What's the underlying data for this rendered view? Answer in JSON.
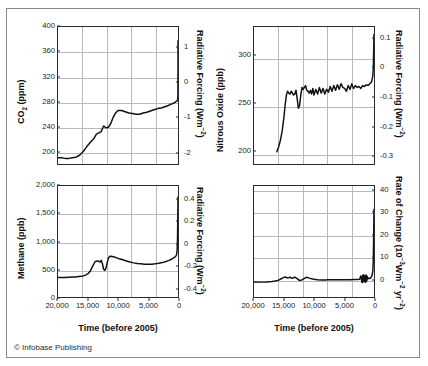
{
  "figure": {
    "credit": "© Infobase Publishing",
    "background_color": "#ffffff",
    "line_color": "#111111",
    "grid_color": "#b9b9b9",
    "axis_color": "#2b2b2b"
  },
  "chart_data": [
    {
      "id": "co2",
      "type": "line",
      "title": "",
      "panel_position": "top-left",
      "xlabel": "",
      "ylabel": "CO2 (ppm)",
      "ylabel_parts": {
        "main": "CO",
        "sub": "2",
        "tail": " (ppm)"
      },
      "y2label": "Radiative Forcing (Wm-2)",
      "y2label_parts": {
        "main": "Radiative Forcing (Wm",
        "sup": "-2",
        "tail": ")"
      },
      "xlim": [
        20000,
        0
      ],
      "ylim": [
        180,
        400
      ],
      "y2lim": [
        -2.35,
        1.6
      ],
      "xticks": [
        20000,
        15000,
        10000,
        5000,
        0
      ],
      "xticklabels": [
        "20,000",
        "15,000",
        "10,000",
        "5,000",
        "0"
      ],
      "yticks": [
        200,
        240,
        280,
        320,
        360,
        400
      ],
      "yticklabels": [
        "200",
        "240",
        "280",
        "320",
        "360",
        "400"
      ],
      "y2ticks": [
        -2,
        -1,
        0,
        1
      ],
      "y2ticklabels": [
        "-2",
        "-1",
        "0",
        "1"
      ],
      "grid": true,
      "x": [
        20000,
        19400,
        18800,
        18200,
        17600,
        17000,
        16400,
        15800,
        15200,
        14600,
        14000,
        13600,
        13200,
        12800,
        12400,
        12000,
        11600,
        11200,
        10800,
        10400,
        10000,
        9400,
        8800,
        8200,
        7600,
        7000,
        6400,
        5800,
        5200,
        4600,
        4000,
        3400,
        2800,
        2200,
        1600,
        1200,
        900,
        700,
        500,
        350,
        250,
        180,
        140,
        110,
        80,
        55,
        40,
        25,
        15,
        8,
        3,
        0
      ],
      "y": [
        190,
        190,
        189,
        189,
        190,
        191,
        194,
        200,
        208,
        215,
        221,
        228,
        230,
        232,
        241,
        238,
        239,
        245,
        255,
        262,
        266,
        266,
        264,
        262,
        261,
        260,
        260,
        262,
        263,
        265,
        267,
        269,
        270,
        272,
        274,
        276,
        277,
        278,
        279,
        280,
        281,
        281,
        282,
        282,
        283,
        284,
        285,
        288,
        295,
        310,
        340,
        378
      ],
      "annotations": [
        "sharp industrial-era spike to ~378 ppm at time 0"
      ]
    },
    {
      "id": "n2o",
      "type": "line",
      "title": "",
      "panel_position": "top-right",
      "xlabel": "",
      "ylabel": "Nitrous Oxide (ppb)",
      "y2label": "Radiative Forcing (Wm-2)",
      "y2label_parts": {
        "main": "Radiative Forcing (Wm",
        "sup": "-2",
        "tail": ")"
      },
      "xlim": [
        20000,
        0
      ],
      "ylim": [
        185,
        330
      ],
      "y2lim": [
        -0.33,
        0.14
      ],
      "xticks": [
        20000,
        15000,
        10000,
        5000,
        0
      ],
      "xticklabels": [
        "20,000",
        "15,000",
        "10,000",
        "5,000",
        "0"
      ],
      "yticks": [
        200,
        250,
        300
      ],
      "yticklabels": [
        "200",
        "250",
        "300"
      ],
      "y2ticks": [
        -0.3,
        -0.2,
        -0.1,
        0,
        0.1
      ],
      "y2ticklabels": [
        "-0.3",
        "-0.2",
        "-0.1",
        "0",
        "0.1"
      ],
      "grid": true,
      "x": [
        16200,
        15900,
        15600,
        15300,
        15000,
        14800,
        14600,
        14400,
        14200,
        14000,
        13800,
        13600,
        13400,
        13200,
        13000,
        12800,
        12600,
        12400,
        12200,
        12000,
        11800,
        11600,
        11400,
        11200,
        11000,
        10800,
        10600,
        10400,
        10200,
        10000,
        9700,
        9400,
        9100,
        8800,
        8500,
        8200,
        7900,
        7600,
        7300,
        7000,
        6700,
        6400,
        6100,
        5800,
        5500,
        5200,
        4900,
        4600,
        4300,
        4000,
        3700,
        3400,
        3100,
        2800,
        2500,
        2200,
        1900,
        1600,
        1300,
        1000,
        700,
        400,
        200,
        100,
        40,
        0
      ],
      "y": [
        198,
        203,
        210,
        220,
        235,
        248,
        258,
        262,
        260,
        259,
        262,
        260,
        258,
        259,
        263,
        254,
        244,
        247,
        258,
        266,
        264,
        266,
        268,
        263,
        262,
        260,
        263,
        259,
        265,
        258,
        264,
        259,
        266,
        260,
        265,
        259,
        264,
        261,
        267,
        262,
        268,
        263,
        269,
        264,
        270,
        266,
        265,
        262,
        268,
        264,
        270,
        265,
        268,
        266,
        267,
        265,
        268,
        267,
        269,
        268,
        270,
        272,
        278,
        290,
        310,
        322
      ],
      "annotations": [
        "rapid rise at end of last glacial, stable Holocene plateau ~265 ppb, industrial spike to ~320 ppb"
      ]
    },
    {
      "id": "methane",
      "type": "line",
      "title": "",
      "panel_position": "bottom-left",
      "xlabel": "Time (before 2005)",
      "ylabel": "Methane (ppb)",
      "y2label": "Radiative Forcing (Wm-2)",
      "y2label_parts": {
        "main": "Radiative Forcing (Wm",
        "sup": "-2",
        "tail": ")"
      },
      "xlim": [
        20000,
        0
      ],
      "ylim": [
        0,
        2000
      ],
      "y2lim": [
        -0.48,
        0.52
      ],
      "xticks": [
        20000,
        15000,
        10000,
        5000,
        0
      ],
      "xticklabels": [
        "20,000",
        "15,000",
        "10,000",
        "5,000",
        "0"
      ],
      "yticks": [
        0,
        500,
        1000,
        1500,
        2000
      ],
      "yticklabels": [
        "0",
        "500",
        "1,000",
        "1,500",
        "2,000"
      ],
      "y2ticks": [
        -0.4,
        -0.2,
        0,
        0.2,
        0.4
      ],
      "y2ticklabels": [
        "-0.4",
        "-0.2",
        "0",
        "0.2",
        "0.4"
      ],
      "grid": true,
      "x": [
        20000,
        19400,
        18800,
        18200,
        17600,
        17000,
        16600,
        16200,
        15800,
        15400,
        15000,
        14600,
        14200,
        13800,
        13400,
        13000,
        12800,
        12600,
        12400,
        12200,
        12000,
        11800,
        11600,
        11400,
        11200,
        11000,
        10600,
        10200,
        9800,
        9200,
        8600,
        8000,
        7400,
        6800,
        6200,
        5600,
        5000,
        4400,
        3800,
        3200,
        2600,
        2000,
        1500,
        1100,
        800,
        600,
        400,
        250,
        150,
        80,
        30,
        0
      ],
      "y": [
        350,
        350,
        352,
        356,
        360,
        362,
        368,
        372,
        380,
        395,
        420,
        470,
        560,
        640,
        650,
        630,
        660,
        600,
        500,
        480,
        520,
        620,
        700,
        730,
        735,
        730,
        720,
        705,
        690,
        670,
        650,
        630,
        615,
        605,
        598,
        592,
        590,
        592,
        598,
        608,
        620,
        640,
        660,
        680,
        700,
        715,
        730,
        760,
        830,
        1050,
        1450,
        1800
      ],
      "annotations": [
        "glacial low ~350 ppb, Bolling-Allerod rise, Younger Dryas dip, Holocene minimum ~590 ppb, industrial spike to ~1,800 ppb"
      ]
    },
    {
      "id": "rate-of-change",
      "type": "line",
      "title": "",
      "panel_position": "bottom-right",
      "xlabel": "Time (before 2005)",
      "ylabel": "",
      "y2label": "Rate of Change (10-3Wm-2 yr-2)",
      "y2label_parts": {
        "main": "Rate of Change (10",
        "sup1": "-3",
        "mid": "Wm",
        "sup2": "-2",
        "mid2": " yr",
        "sup3": "-2",
        "tail": ")"
      },
      "xlim": [
        20000,
        0
      ],
      "ylim": [
        -8,
        42
      ],
      "xticks": [
        20000,
        15000,
        10000,
        5000,
        0
      ],
      "xticklabels": [
        "20,000",
        "15,000",
        "10,000",
        "5,000",
        "0"
      ],
      "y2ticks": [
        0,
        10,
        20,
        30,
        40
      ],
      "y2ticklabels": [
        "0",
        "10",
        "20",
        "30",
        "40"
      ],
      "grid": true,
      "x": [
        20000,
        19000,
        18000,
        17000,
        16500,
        16000,
        15600,
        15200,
        14800,
        14400,
        14000,
        13600,
        13200,
        12800,
        12400,
        12000,
        11600,
        11200,
        10800,
        10400,
        10000,
        9400,
        8800,
        8200,
        7600,
        7000,
        6400,
        5800,
        5200,
        4600,
        4000,
        3400,
        2800,
        2400,
        2200,
        2000,
        1900,
        1800,
        1700,
        1600,
        1500,
        1400,
        1300,
        1200,
        1100,
        1000,
        900,
        800,
        700,
        600,
        500,
        400,
        300,
        200,
        120,
        60,
        20,
        0
      ],
      "y": [
        -1.2,
        -1.3,
        -1.2,
        -1.0,
        -0.8,
        -0.5,
        0.0,
        0.6,
        1.0,
        0.5,
        0.9,
        0.4,
        1.0,
        0.3,
        -0.6,
        -0.3,
        0.4,
        0.9,
        0.5,
        0.2,
        0.0,
        -0.2,
        -0.3,
        -0.3,
        -0.2,
        -0.2,
        -0.2,
        -0.2,
        -0.2,
        -0.2,
        -0.2,
        -0.1,
        -0.1,
        0.0,
        1.5,
        -1.5,
        1.8,
        -1.2,
        2.0,
        -1.0,
        1.6,
        -1.4,
        1.9,
        -0.8,
        1.2,
        0.2,
        0.4,
        0.3,
        0.5,
        0.4,
        0.8,
        1.2,
        2.0,
        3.5,
        8.0,
        18.0,
        28.0,
        31.5
      ],
      "annotations": [
        "near-zero natural variability; abrupt modern spike to ~31"
      ]
    }
  ]
}
